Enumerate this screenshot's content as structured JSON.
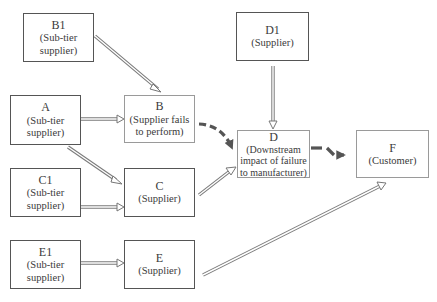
{
  "diagram": {
    "nodes": [
      {
        "id": "B1",
        "role": "(Sub-tier supplier)"
      },
      {
        "id": "A",
        "role": "(Sub-tier supplier)"
      },
      {
        "id": "B",
        "role": "(Supplier fails to perform)"
      },
      {
        "id": "D1",
        "role": "(Supplier)"
      },
      {
        "id": "D",
        "role": "(Downstream impact of failure to manufacturer)"
      },
      {
        "id": "F",
        "role": "(Customer)"
      },
      {
        "id": "C1",
        "role": "(Sub-tier supplier)"
      },
      {
        "id": "C",
        "role": "(Supplier)"
      },
      {
        "id": "E1",
        "role": "(Sub-tier supplier)"
      },
      {
        "id": "E",
        "role": "(Supplier)"
      }
    ],
    "edges": [
      {
        "from": "B1",
        "to": "B",
        "style": "hollow"
      },
      {
        "from": "A",
        "to": "B",
        "style": "hollow"
      },
      {
        "from": "A",
        "to": "C",
        "style": "hollow"
      },
      {
        "from": "C1",
        "to": "C",
        "style": "hollow"
      },
      {
        "from": "E1",
        "to": "E",
        "style": "hollow"
      },
      {
        "from": "D1",
        "to": "D",
        "style": "hollow"
      },
      {
        "from": "C",
        "to": "D",
        "style": "hollow"
      },
      {
        "from": "E",
        "to": "F",
        "style": "hollow"
      },
      {
        "from": "B",
        "to": "D",
        "style": "dashed-bold"
      },
      {
        "from": "D",
        "to": "F",
        "style": "dashed-bold"
      }
    ],
    "colors": {
      "box_border": "#555555",
      "hollow_arrow": "#7a7a7a",
      "dashed_arrow": "#555555"
    }
  }
}
